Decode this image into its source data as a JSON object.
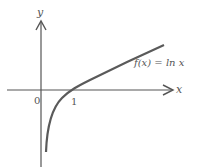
{
  "figure": {
    "function_label": "f(x) = ln x",
    "x_axis_label": "x",
    "y_axis_label": "y",
    "origin_label": "0",
    "x_tick_label": "1",
    "colors": {
      "axis": "#555555",
      "curve": "#5a5a5a",
      "text": "#555555",
      "background": "#ffffff"
    }
  }
}
